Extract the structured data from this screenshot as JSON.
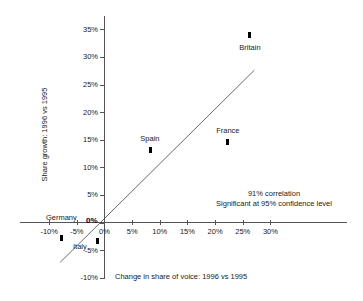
{
  "chart_data": {
    "type": "scatter",
    "title": "",
    "xlabel": "Change in share of voice: 1996 vs 1995",
    "ylabel": "Share growth: 1996 vs 1995",
    "xlim": [
      -10,
      30
    ],
    "ylim": [
      -10,
      35
    ],
    "grid": false,
    "legend": "none",
    "x_ticks": [
      "-10%",
      "-5%",
      "0%",
      "5%",
      "10%",
      "15%",
      "20%",
      "25%",
      "30%"
    ],
    "x_tick_values": [
      -10,
      -5,
      0,
      5,
      10,
      15,
      20,
      25,
      30
    ],
    "y_ticks": [
      "35%",
      "30%",
      "25%",
      "20%",
      "15%",
      "10%",
      "5%",
      "0%",
      "-5%",
      "-10%"
    ],
    "y_tick_values": [
      35,
      30,
      25,
      20,
      15,
      10,
      5,
      0,
      -5,
      -10
    ],
    "origin_label": "0%",
    "points": [
      {
        "label": "Britain",
        "x": 26.3,
        "y": 34.0,
        "label_dx": 0,
        "label_dy": 12
      },
      {
        "label": "France",
        "x": 22.3,
        "y": 14.6,
        "label_dx": 0,
        "label_dy": -12
      },
      {
        "label": "Spain",
        "x": 8.4,
        "y": 13.2,
        "label_dx": -1,
        "label_dy": -12
      },
      {
        "label": "Germany",
        "x": -7.8,
        "y": -2.8,
        "label_dx": 0,
        "label_dy": -21
      },
      {
        "label": "Italy",
        "x": -1.2,
        "y": -3.3,
        "label_dx": -18,
        "label_dy": 5
      }
    ],
    "trendline": {
      "x_start": -8.0,
      "y_start": -7.2,
      "x_end": 27.1,
      "y_end": 27.6
    },
    "annotations": [
      "91% correlation",
      "Significant at 95% confidence level"
    ]
  }
}
